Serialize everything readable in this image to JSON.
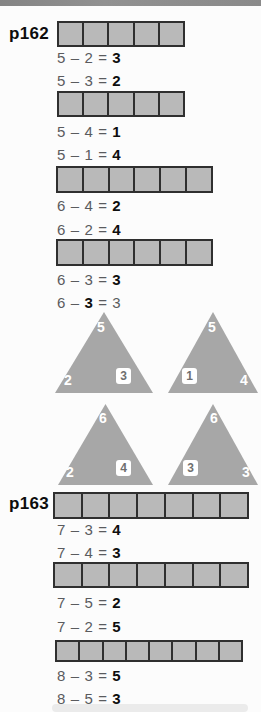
{
  "labels": {
    "p162": "p162",
    "p163": "p163"
  },
  "colors": {
    "top_edge": "#8a8a8a",
    "cell_fill": "#b9b9b9",
    "cell_border": "#2f2f2f",
    "triangle_fill": "#a7a7a7",
    "equation_text": "#5a5b5e",
    "answer_text": "#0e0e0e",
    "background": "#fcfcfc"
  },
  "bars": [
    {
      "cells": 5
    },
    {
      "cells": 5
    },
    {
      "cells": 6
    },
    {
      "cells": 6
    },
    {
      "cells": 7
    },
    {
      "cells": 7
    },
    {
      "cells": 8
    }
  ],
  "equations": [
    {
      "pre": "5 – 2 = ",
      "bold": "3",
      "post": ""
    },
    {
      "pre": "5 – 3 = ",
      "bold": "2",
      "post": ""
    },
    {
      "pre": "5 – 4 = ",
      "bold": "1",
      "post": ""
    },
    {
      "pre": "5 – 1 = ",
      "bold": "4",
      "post": ""
    },
    {
      "pre": "6 – 4 = ",
      "bold": "2",
      "post": ""
    },
    {
      "pre": "6 – 2 = ",
      "bold": "4",
      "post": ""
    },
    {
      "pre": "6 – 3 = ",
      "bold": "3",
      "post": ""
    },
    {
      "pre": "6 – ",
      "bold": "3",
      "post": " = 3"
    },
    {
      "pre": "7 – 3 = ",
      "bold": "4",
      "post": ""
    },
    {
      "pre": "7 – 4 = ",
      "bold": "3",
      "post": ""
    },
    {
      "pre": "7 – 5 = ",
      "bold": "2",
      "post": ""
    },
    {
      "pre": "7 – 2 = ",
      "bold": "5",
      "post": ""
    },
    {
      "pre": "8 – 3 = ",
      "bold": "5",
      "post": ""
    },
    {
      "pre": "8 – 5 = ",
      "bold": "3",
      "post": ""
    }
  ],
  "triangles": [
    {
      "top": "5",
      "bottom_left": "2",
      "bottom_right": "3",
      "boxed": "bottom_right"
    },
    {
      "top": "5",
      "bottom_left": "1",
      "bottom_right": "4",
      "boxed": "bottom_left"
    },
    {
      "top": "6",
      "bottom_left": "2",
      "bottom_right": "4",
      "boxed": "bottom_right"
    },
    {
      "top": "6",
      "bottom_left": "3",
      "bottom_right": "3",
      "boxed": "bottom_left"
    }
  ]
}
